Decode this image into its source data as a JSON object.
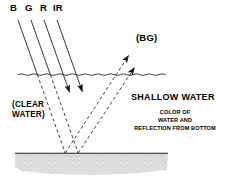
{
  "diagram": {
    "band_labels": [
      {
        "text": "B",
        "x": 10,
        "y": 4
      },
      {
        "text": "G",
        "x": 25,
        "y": 4
      },
      {
        "text": "R",
        "x": 40,
        "y": 4
      },
      {
        "text": "IR",
        "x": 53,
        "y": 4
      }
    ],
    "bg_label": {
      "text": "(BG)",
      "x": 136,
      "y": 34
    },
    "clear_water_label": {
      "line1": "(CLEAR",
      "line2": "WATER)",
      "x": 12,
      "y": 101
    },
    "shallow_water_label": {
      "text": "SHALLOW WATER",
      "x": 131,
      "y": 93
    },
    "detail_label": {
      "line1": "COLOR OF",
      "line2": "WATER AND",
      "line3": "REFLECTION FROM BOTTOM",
      "x": 129,
      "y": 107
    },
    "surface": {
      "label": "water-surface",
      "y": 74,
      "x_start": 18,
      "x_end": 170
    },
    "bottom": {
      "label": "sea-bottom",
      "y": 153,
      "x_start": 15,
      "x_end": 168
    },
    "sediment": {
      "label": "sediment-texture",
      "top": 154,
      "bottom": 176
    },
    "colors": {
      "line": "#1a1a1a",
      "background": "#ffffff",
      "sediment_fill": "#d8d8d8",
      "sediment_stipple": "#9a9a9a"
    },
    "incoming_rays": [
      {
        "band": "B",
        "x1": 18,
        "y1": 20,
        "x2": 58,
        "y2": 133
      },
      {
        "band": "G",
        "x1": 31,
        "y1": 20,
        "x2": 71,
        "y2": 133
      },
      {
        "band": "R",
        "x1": 44,
        "y1": 20,
        "x2": 74,
        "y2": 90
      },
      {
        "band": "IR",
        "x1": 57,
        "y1": 20,
        "x2": 87,
        "y2": 88
      }
    ],
    "reflected_rays": [
      {
        "from_x": 78,
        "from_y": 153,
        "to_x": 134,
        "to_y": 52
      },
      {
        "from_x": 92,
        "from_y": 153,
        "to_x": 140,
        "to_y": 66
      }
    ]
  }
}
